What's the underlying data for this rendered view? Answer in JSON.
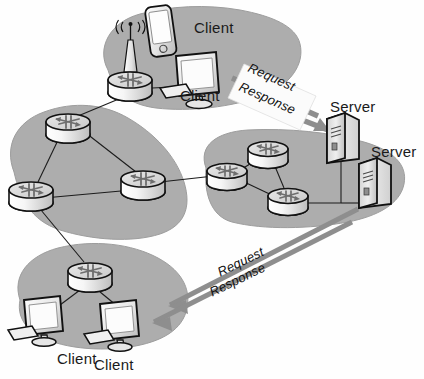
{
  "diagram": {
    "background_color": "#fefefe",
    "cloud_color": "#adadad",
    "cloud_edge_color": "#9a9a9a",
    "link_color": "#1c1c1c",
    "arrow_color": "#8e8e8e",
    "device_fill": "#f2f2f2",
    "device_edge": "#111111"
  },
  "clouds": [
    {
      "id": "lan-wireless",
      "name": "wireless-access-lan"
    },
    {
      "id": "core-left",
      "name": "core-router-mesh-left"
    },
    {
      "id": "core-right",
      "name": "server-farm-network"
    },
    {
      "id": "lan-bottom",
      "name": "branch-client-lan"
    }
  ],
  "labels": {
    "client_phone": "Client",
    "client_desktop_top": "Client",
    "client_desktop_bottom_left": "Client",
    "client_desktop_bottom_right": "Client",
    "server_top": "Server",
    "server_bottom": "Server"
  },
  "flows": [
    {
      "id": "flow-top",
      "request": "Request",
      "response": "Response",
      "direction": "bidirectional",
      "from": "client-desktop-top",
      "to": "server-top"
    },
    {
      "id": "flow-bottom",
      "request": "Request",
      "response": "Response",
      "direction": "bidirectional",
      "from": "client-desktop-bottom-right",
      "to": "server-bottom"
    }
  ],
  "nodes": {
    "access_point": {
      "name": "wireless-access-point",
      "x": 130,
      "y": 55
    },
    "routers": [
      {
        "name": "router-wireless-lan",
        "x": 130,
        "y": 82
      },
      {
        "name": "router-core-top",
        "x": 68,
        "y": 124
      },
      {
        "name": "router-core-left",
        "x": 31,
        "y": 192
      },
      {
        "name": "router-core-right",
        "x": 143,
        "y": 181
      },
      {
        "name": "router-farm-left",
        "x": 227,
        "y": 173
      },
      {
        "name": "router-farm-top",
        "x": 268,
        "y": 151
      },
      {
        "name": "router-farm-bottom",
        "x": 288,
        "y": 198
      },
      {
        "name": "router-branch-lan",
        "x": 90,
        "y": 273
      }
    ],
    "servers": [
      {
        "name": "server-top",
        "x": 341,
        "y": 139
      },
      {
        "name": "server-bottom",
        "x": 373,
        "y": 184
      }
    ],
    "clients": [
      {
        "name": "client-mobile-phone",
        "x": 161,
        "y": 32
      },
      {
        "name": "client-desktop-top",
        "x": 196,
        "y": 78
      },
      {
        "name": "client-desktop-bottom-left",
        "x": 42,
        "y": 318
      },
      {
        "name": "client-desktop-bottom-right",
        "x": 118,
        "y": 323
      }
    ]
  }
}
